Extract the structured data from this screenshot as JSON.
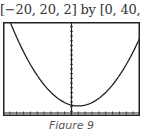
{
  "window_label": "[−20, 20, 2] by [0, 40, 2]",
  "caption": "Figure 9",
  "chart_data": {
    "type": "line",
    "title": "[−20, 20, 2] by [0, 40, 2]",
    "xlabel": "",
    "ylabel": "",
    "xlim": [
      -20,
      20
    ],
    "ylim": [
      0,
      40
    ],
    "xscale": 2,
    "yscale": 2,
    "grid": false,
    "legend": null,
    "series": [
      {
        "name": "parabola",
        "description": "upward-opening parabola, vertex near (2, 3)",
        "x": [
          -18.5,
          -16,
          -14,
          -12,
          -10,
          -8,
          -6,
          -4,
          -2,
          0,
          2,
          4,
          6,
          8,
          10,
          12,
          14,
          16,
          18,
          20
        ],
        "values": [
          40,
          35,
          26,
          20.6,
          16,
          12,
          8.8,
          6.2,
          4.4,
          3.4,
          3,
          3.4,
          4.4,
          6.2,
          8.8,
          12,
          16,
          20.6,
          26,
          31.2
        ]
      }
    ],
    "annotations": [
      "Figure 9"
    ]
  },
  "colors": {
    "curve": "#222222",
    "frame": "#222222",
    "axis": "#222222"
  }
}
